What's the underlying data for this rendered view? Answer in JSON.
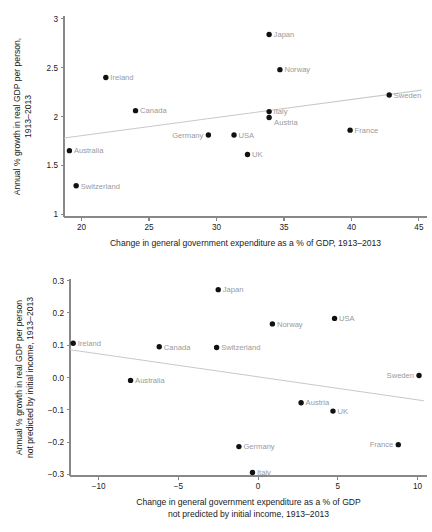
{
  "figure": {
    "title": "",
    "panels": [
      "top",
      "bottom"
    ]
  },
  "chart_data": [
    {
      "id": "top",
      "type": "scatter",
      "title": "",
      "xlabel": "Change in general government expenditure as a % of GDP, 1913–2013",
      "ylabel_line1": "Annual % growth in real GDP per person,",
      "ylabel_line2": "1913–2013",
      "xlim": [
        18.7,
        45.6
      ],
      "ylim": [
        0.97,
        3.03
      ],
      "xticks": [
        20,
        25,
        30,
        35,
        40,
        45
      ],
      "xtick_labels": [
        "20",
        "25",
        "30",
        "35",
        "40",
        "45"
      ],
      "yticks": [
        1,
        1.5,
        2,
        2.5,
        3
      ],
      "ytick_labels": [
        "1",
        "1.5",
        "2",
        "2.5",
        "3"
      ],
      "grid": false,
      "legend": "none",
      "points": [
        {
          "label": "Japan",
          "x": 33.9,
          "y": 2.84,
          "label_side": "right"
        },
        {
          "label": "Norway",
          "x": 34.7,
          "y": 2.48,
          "label_side": "right"
        },
        {
          "label": "Ireland",
          "x": 21.8,
          "y": 2.4,
          "label_side": "right"
        },
        {
          "label": "Sweden",
          "x": 42.8,
          "y": 2.22,
          "label_side": "right"
        },
        {
          "label": "Canada",
          "x": 24.0,
          "y": 2.06,
          "label_side": "right"
        },
        {
          "label": "Italy",
          "x": 33.9,
          "y": 2.05,
          "label_side": "right"
        },
        {
          "label": "Austria",
          "x": 33.9,
          "y": 1.99,
          "label_side": "right-below"
        },
        {
          "label": "France",
          "x": 39.9,
          "y": 1.86,
          "label_side": "right"
        },
        {
          "label": "Germany",
          "x": 29.4,
          "y": 1.81,
          "label_side": "left"
        },
        {
          "label": "USA",
          "x": 31.3,
          "y": 1.81,
          "label_side": "right"
        },
        {
          "label": "Australia",
          "x": 19.1,
          "y": 1.65,
          "label_side": "right"
        },
        {
          "label": "UK",
          "x": 32.3,
          "y": 1.61,
          "label_side": "right"
        },
        {
          "label": "Switzerland",
          "x": 19.6,
          "y": 1.29,
          "label_side": "right"
        }
      ],
      "trend": {
        "x1": 18.7,
        "y1": 1.78,
        "x2": 45.2,
        "y2": 2.27
      }
    },
    {
      "id": "bottom",
      "type": "scatter",
      "title": "",
      "xlabel_line1": "Change in general government expenditure as a % of GDP",
      "xlabel_line2": "not predicted by initial income, 1913–2013",
      "ylabel_line1": "Annual % growth in real GDP per person",
      "ylabel_line2": "not predicted by initial income, 1913–2013",
      "xlim": [
        -11.8,
        10.6
      ],
      "ylim": [
        -0.305,
        0.305
      ],
      "xticks": [
        -10,
        -5,
        0,
        5,
        10
      ],
      "xtick_labels": [
        "−10",
        "−5",
        "0",
        "5",
        "10"
      ],
      "yticks": [
        -0.3,
        -0.2,
        -0.1,
        0.0,
        0.1,
        0.2,
        0.3
      ],
      "ytick_labels": [
        "−0.3",
        "−0.2",
        "−0.1",
        "0.0",
        "0.1",
        "0.2",
        "0.3"
      ],
      "grid": false,
      "legend": "none",
      "points": [
        {
          "label": "Japan",
          "x": -2.5,
          "y": 0.272,
          "label_side": "right"
        },
        {
          "label": "USA",
          "x": 4.8,
          "y": 0.183,
          "label_side": "right"
        },
        {
          "label": "Norway",
          "x": 0.9,
          "y": 0.166,
          "label_side": "right"
        },
        {
          "label": "Ireland",
          "x": -11.6,
          "y": 0.106,
          "label_side": "right"
        },
        {
          "label": "Canada",
          "x": -6.2,
          "y": 0.095,
          "label_side": "right"
        },
        {
          "label": "Switzerland",
          "x": -2.6,
          "y": 0.093,
          "label_side": "right"
        },
        {
          "label": "Sweden",
          "x": 10.1,
          "y": 0.006,
          "label_side": "left"
        },
        {
          "label": "Australia",
          "x": -8.0,
          "y": -0.009,
          "label_side": "right"
        },
        {
          "label": "Austria",
          "x": 2.7,
          "y": -0.078,
          "label_side": "right"
        },
        {
          "label": "UK",
          "x": 4.7,
          "y": -0.104,
          "label_side": "right"
        },
        {
          "label": "Germany",
          "x": -1.2,
          "y": -0.214,
          "label_side": "right"
        },
        {
          "label": "France",
          "x": 8.8,
          "y": -0.208,
          "label_side": "left"
        },
        {
          "label": "Italy",
          "x": -0.35,
          "y": -0.294,
          "label_side": "right"
        }
      ],
      "trend": {
        "x1": -11.8,
        "y1": 0.086,
        "x2": 10.4,
        "y2": -0.072
      }
    }
  ],
  "colors": {
    "marker": "#111111",
    "label": "#9a9a9a",
    "axis": "#888888",
    "trend": "#c9c9c9",
    "background": "#ffffff"
  }
}
